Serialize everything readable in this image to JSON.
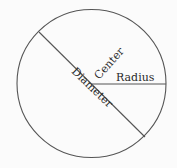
{
  "diagram": {
    "title": "",
    "labels": {
      "center": "Center",
      "radius": "Radius",
      "diameter": "Diameter"
    },
    "colors": {
      "stroke": "#555555",
      "text": "#2a2a2a",
      "background": "#fbfbfb"
    }
  }
}
